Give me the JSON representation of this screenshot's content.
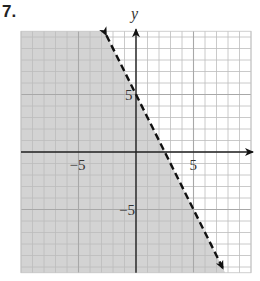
{
  "problem_number": "7.",
  "chart_data": {
    "type": "line",
    "title": "",
    "xlabel": "",
    "ylabel": "y",
    "xlim": [
      -10,
      10
    ],
    "ylim": [
      -10.5,
      10.5
    ],
    "grid": true,
    "grid_step": 1,
    "tick_labels": {
      "x": [
        {
          "value": -5,
          "label": "−5"
        },
        {
          "value": 5,
          "label": "5"
        }
      ],
      "y": [
        {
          "value": 5,
          "label": "5"
        },
        {
          "value": -5,
          "label": "−5"
        }
      ]
    },
    "boundary_line": {
      "equation": "y = -2x + 5",
      "slope": -2,
      "y_intercept": 5,
      "x_intercept": 2.5,
      "style": "dashed",
      "arrows": "both"
    },
    "shaded_region": {
      "inequality": "y < -2x + 5",
      "side": "left/below",
      "color": "#d3d3d3"
    },
    "colors": {
      "grid": "#bdbdbd",
      "axes": "#222222",
      "shade": "#d3d3d3",
      "line": "#111111"
    }
  }
}
